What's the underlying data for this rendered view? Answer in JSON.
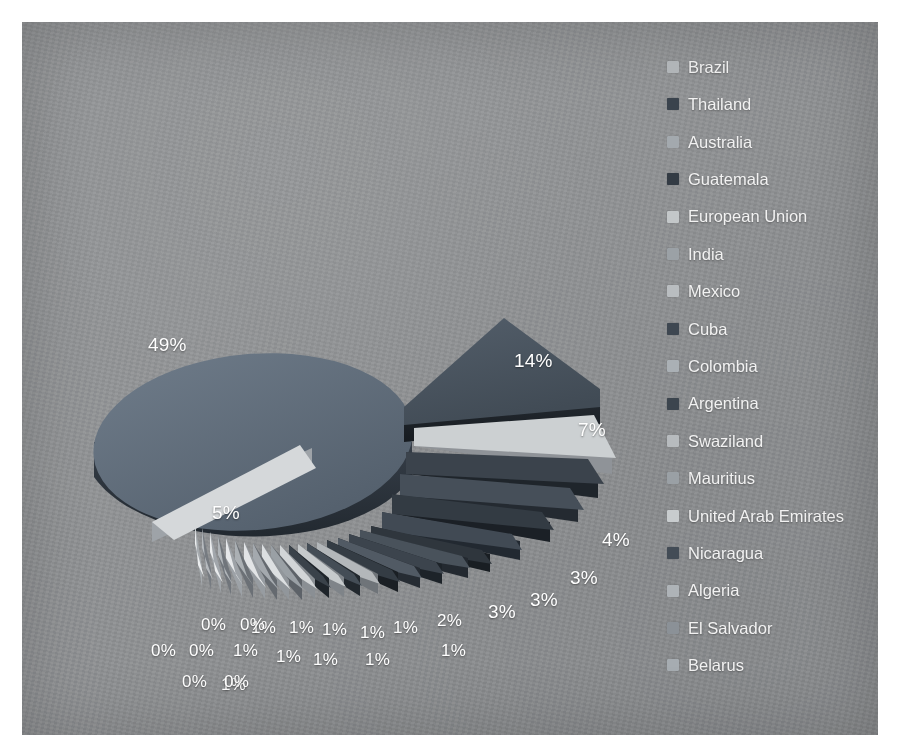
{
  "chart_data": {
    "type": "pie",
    "title": "",
    "subtitle": "",
    "exploded": true,
    "three_d": true,
    "legend_position": "right",
    "grid": false,
    "value_unit": "percent",
    "categories": [
      "Brazil",
      "Thailand",
      "Australia",
      "Guatemala",
      "European Union",
      "India",
      "Mexico",
      "Cuba",
      "Colombia",
      "Argentina",
      "Swaziland",
      "Mauritius",
      "United Arab Emirates",
      "Nicaragua",
      "Algeria",
      "El Salvador",
      "Belarus"
    ],
    "values": [
      49,
      14,
      7,
      5,
      4,
      3,
      3,
      3,
      2,
      1,
      1,
      1,
      1,
      1,
      1,
      0,
      0
    ],
    "labels_shown": [
      "49%",
      "14%",
      "7%",
      "5%",
      "4%",
      "3%",
      "3%",
      "3%",
      "2%",
      "1%",
      "1%",
      "1%",
      "1%",
      "1%",
      "1%",
      "1%",
      "1%",
      "1%",
      "1%",
      "1%",
      "1%",
      "1%",
      "0%",
      "0%",
      "0%",
      "0%",
      "0%",
      "0%"
    ],
    "colors": [
      "#4a5d73",
      "#3c4754",
      "#8d949b",
      "#2f3840",
      "#b9bdc1",
      "#cfd2d4",
      "#9aa0a6",
      "#343c45",
      "#a8adb2",
      "#39424b",
      "#c3c7ca",
      "#8b9197",
      "#d6d9db",
      "#474f58",
      "#a0a6ab",
      "#7e858c",
      "#b2b7bb"
    ]
  },
  "legend": {
    "items": [
      {
        "label": "Brazil",
        "color": "#b4b8bb"
      },
      {
        "label": "Thailand",
        "color": "#3a434d"
      },
      {
        "label": "Australia",
        "color": "#a3a9ae"
      },
      {
        "label": "Guatemala",
        "color": "#333b44"
      },
      {
        "label": "European Union",
        "color": "#c3c7c9"
      },
      {
        "label": "India",
        "color": "#9ba1a6"
      },
      {
        "label": "Mexico",
        "color": "#b9bdc0"
      },
      {
        "label": "Cuba",
        "color": "#3e4751"
      },
      {
        "label": "Colombia",
        "color": "#aab0b5"
      },
      {
        "label": "Argentina",
        "color": "#3c454e"
      },
      {
        "label": "Swaziland",
        "color": "#b7bbbe"
      },
      {
        "label": "Mauritius",
        "color": "#9aa0a5"
      },
      {
        "label": "United Arab Emirates",
        "color": "#c8ccce"
      },
      {
        "label": "Nicaragua",
        "color": "#434c56"
      },
      {
        "label": "Algeria",
        "color": "#aeb3b7"
      },
      {
        "label": "El Salvador",
        "color": "#8b9197"
      },
      {
        "label": "Belarus",
        "color": "#a6acb1"
      }
    ]
  },
  "data_labels": [
    {
      "text": "49%",
      "x": 126,
      "y": 313,
      "size": "big"
    },
    {
      "text": "14%",
      "x": 492,
      "y": 329,
      "size": "big"
    },
    {
      "text": "7%",
      "x": 556,
      "y": 398,
      "size": "big"
    },
    {
      "text": "5%",
      "x": 190,
      "y": 481,
      "size": "big"
    },
    {
      "text": "4%",
      "x": 580,
      "y": 508,
      "size": "big"
    },
    {
      "text": "3%",
      "x": 548,
      "y": 546,
      "size": "big"
    },
    {
      "text": "3%",
      "x": 508,
      "y": 568,
      "size": "big"
    },
    {
      "text": "3%",
      "x": 466,
      "y": 580,
      "size": "big"
    },
    {
      "text": "2%",
      "x": 415,
      "y": 590,
      "size": "normal"
    },
    {
      "text": "1%",
      "x": 419,
      "y": 620,
      "size": "normal"
    },
    {
      "text": "1%",
      "x": 371,
      "y": 597,
      "size": "normal"
    },
    {
      "text": "1%",
      "x": 343,
      "y": 629,
      "size": "normal"
    },
    {
      "text": "1%",
      "x": 338,
      "y": 602,
      "size": "normal"
    },
    {
      "text": "1%",
      "x": 300,
      "y": 599,
      "size": "normal"
    },
    {
      "text": "1%",
      "x": 291,
      "y": 629,
      "size": "normal"
    },
    {
      "text": "1%",
      "x": 267,
      "y": 597,
      "size": "normal"
    },
    {
      "text": "1%",
      "x": 254,
      "y": 626,
      "size": "normal"
    },
    {
      "text": "1%",
      "x": 229,
      "y": 597,
      "size": "normal"
    },
    {
      "text": "1%",
      "x": 211,
      "y": 620,
      "size": "normal"
    },
    {
      "text": "1%",
      "x": 199,
      "y": 654,
      "size": "normal"
    },
    {
      "text": "0%",
      "x": 218,
      "y": 594,
      "size": "normal"
    },
    {
      "text": "0%",
      "x": 179,
      "y": 594,
      "size": "normal"
    },
    {
      "text": "0%",
      "x": 167,
      "y": 620,
      "size": "normal"
    },
    {
      "text": "0%",
      "x": 202,
      "y": 651,
      "size": "normal"
    },
    {
      "text": "0%",
      "x": 160,
      "y": 651,
      "size": "normal"
    },
    {
      "text": "0%",
      "x": 129,
      "y": 620,
      "size": "normal"
    }
  ],
  "pie_geometry": {
    "slices": [
      {
        "name": "Brazil",
        "angle_start": 183,
        "angle_end": 359,
        "explode": 26,
        "top": "#62707f",
        "side": "#2e3640"
      },
      {
        "name": "Thailand",
        "angle_start": 359,
        "angle_end": 409,
        "explode": 24,
        "top": "#4a545f",
        "side": "#20262c"
      },
      {
        "name": "Australia",
        "angle_start": 409,
        "angle_end": 434,
        "explode": 22,
        "top": "#cdd0d2",
        "side": "#8e9296"
      },
      {
        "name": "Guatemala",
        "angle_start": 434,
        "angle_end": 452,
        "explode": 20,
        "top": "#3c444d",
        "side": "#1b2026"
      },
      {
        "name": "EU",
        "angle_start": 452,
        "angle_end": 463,
        "explode": 18,
        "top": "#5a646f",
        "side": "#272d34"
      },
      {
        "name": "India",
        "angle_start": 463,
        "angle_end": 474,
        "explode": 17,
        "top": "#2f363d",
        "side": "#15191d"
      },
      {
        "name": "Mexico",
        "angle_start": 474,
        "angle_end": 485,
        "explode": 16,
        "top": "#565f69",
        "side": "#262b31"
      },
      {
        "name": "Cuba",
        "angle_start": 485,
        "angle_end": 492,
        "explode": 15,
        "top": "#343b43",
        "side": "#171b1f"
      },
      {
        "name": "Colombia",
        "angle_start": 492,
        "angle_end": 497,
        "explode": 15,
        "top": "#5e6872",
        "side": "#2a2f35"
      },
      {
        "name": "Argentina",
        "angle_start": 497,
        "angle_end": 502,
        "explode": 14,
        "top": "#cfd2d4",
        "side": "#909498"
      },
      {
        "name": "Swaziland",
        "angle_start": 502,
        "angle_end": 507,
        "explode": 14,
        "top": "#444c55",
        "side": "#1e2227"
      },
      {
        "name": "Mauritius",
        "angle_start": 507,
        "angle_end": 512,
        "explode": 13,
        "top": "#c9ccce",
        "side": "#8a8e92"
      },
      {
        "name": "UAE",
        "angle_start": 512,
        "angle_end": 517,
        "explode": 13,
        "top": "#4d565f",
        "side": "#22262b"
      },
      {
        "name": "Nicaragua",
        "angle_start": 517,
        "angle_end": 521,
        "explode": 12,
        "top": "#d3d6d8",
        "side": "#94989b"
      },
      {
        "name": "Algeria",
        "angle_start": 521,
        "angle_end": 525,
        "explode": 12,
        "top": "#8a9197",
        "side": "#5c6166"
      },
      {
        "name": "ElSalvador",
        "angle_start": 525,
        "angle_end": 529,
        "explode": 11,
        "top": "#dcdfe1",
        "side": "#9da0a3"
      },
      {
        "name": "Belarus",
        "angle_start": 529,
        "angle_end": 533,
        "explode": 11,
        "top": "#7f868d",
        "side": "#545a5f"
      },
      {
        "name": "x18",
        "angle_start": 533,
        "angle_end": 537,
        "explode": 10,
        "top": "#d8dbdd",
        "side": "#999c9f"
      },
      {
        "name": "x19",
        "angle_start": 537,
        "angle_end": 540,
        "explode": 10,
        "top": "#9299a0",
        "side": "#62686d"
      },
      {
        "name": "x20",
        "angle_start": 540,
        "angle_end": 543,
        "explode": 10,
        "top": "#e0e3e4",
        "side": "#9ea1a4"
      },
      {
        "name": "x21",
        "angle_start": 543,
        "angle_end": 523,
        "explode": 9,
        "top": "#a7adb2",
        "side": "#70757a"
      }
    ]
  }
}
